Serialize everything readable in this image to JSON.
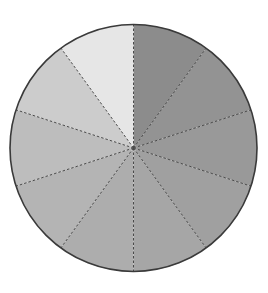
{
  "chart_data": {
    "type": "pie",
    "title": "",
    "start_angle_deg": 0,
    "direction": "clockwise",
    "center": [
      133.5,
      148
    ],
    "radius": 123.5,
    "outline_color": "#3a3a3a",
    "separator_style": "dashed",
    "separator_color": "#4a4a4a",
    "legend": "none",
    "categories": [
      "1",
      "2",
      "3",
      "4",
      "5",
      "6",
      "7",
      "8",
      "9",
      "10"
    ],
    "values": [
      10,
      10,
      10,
      10,
      10,
      10,
      10,
      10,
      10,
      10
    ],
    "colors": [
      "#8c8c8c",
      "#939393",
      "#999999",
      "#a0a0a0",
      "#a6a6a6",
      "#adadad",
      "#b4b4b4",
      "#bdbdbd",
      "#cccccc",
      "#e6e6e6"
    ]
  }
}
